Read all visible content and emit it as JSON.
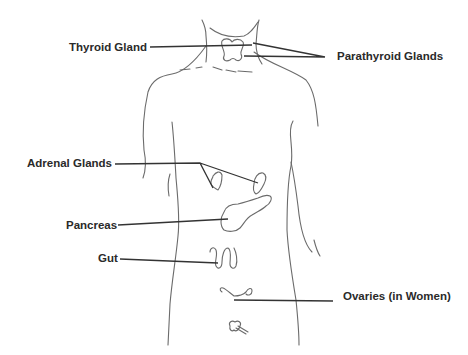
{
  "diagram": {
    "type": "anatomical-diagram",
    "colors": {
      "outline": "#6b6b6b",
      "leader_line": "#333333",
      "label_text": "#2a2a2a",
      "background": "#ffffff"
    },
    "labels": [
      {
        "id": "thyroid",
        "text": "Thyroid Gland"
      },
      {
        "id": "parathyroid",
        "text": "Parathyroid Glands"
      },
      {
        "id": "adrenal",
        "text": "Adrenal Glands"
      },
      {
        "id": "pancreas",
        "text": "Pancreas"
      },
      {
        "id": "gut",
        "text": "Gut"
      },
      {
        "id": "ovaries",
        "text": "Ovaries (in Women)"
      }
    ]
  }
}
